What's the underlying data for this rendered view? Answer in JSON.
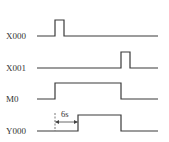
{
  "diagram": {
    "type": "timing-diagram",
    "signals": [
      {
        "name": "X000",
        "label": "X000",
        "baseline_y": 36,
        "high_y": 20,
        "label_x": 6,
        "points": [
          [
            37,
            36
          ],
          [
            55,
            36
          ],
          [
            55,
            20
          ],
          [
            64,
            20
          ],
          [
            64,
            36
          ],
          [
            158,
            36
          ]
        ]
      },
      {
        "name": "X001",
        "label": "X001",
        "baseline_y": 68,
        "high_y": 52,
        "label_x": 6,
        "points": [
          [
            37,
            68
          ],
          [
            121,
            68
          ],
          [
            121,
            52
          ],
          [
            130,
            52
          ],
          [
            130,
            68
          ],
          [
            158,
            68
          ]
        ]
      },
      {
        "name": "M0",
        "label": "M0",
        "baseline_y": 99,
        "high_y": 83,
        "label_x": 6,
        "points": [
          [
            37,
            99
          ],
          [
            55,
            99
          ],
          [
            55,
            83
          ],
          [
            121,
            83
          ],
          [
            121,
            99
          ],
          [
            158,
            99
          ]
        ]
      },
      {
        "name": "Y000",
        "label": "Y000",
        "baseline_y": 131,
        "high_y": 115,
        "label_x": 6,
        "points": [
          [
            37,
            131
          ],
          [
            78,
            131
          ],
          [
            78,
            115
          ],
          [
            121,
            115
          ],
          [
            121,
            131
          ],
          [
            158,
            131
          ]
        ]
      }
    ],
    "delay_annotation": {
      "label": "6s",
      "from_x": 55,
      "to_x": 78,
      "arrow_y": 122,
      "label_x": 61,
      "label_y": 117
    },
    "colors": {
      "line": "#3a3a3a",
      "text": "#333333",
      "background": "#ffffff"
    }
  }
}
